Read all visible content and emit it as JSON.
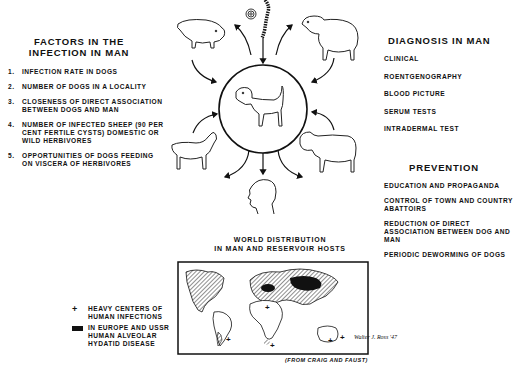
{
  "factors": {
    "title": "FACTORS IN THE INFECTION IN MAN",
    "items": [
      {
        "num": "1.",
        "text": "INFECTION RATE IN DOGS"
      },
      {
        "num": "2.",
        "text": "NUMBER OF DOGS IN A LOCALITY"
      },
      {
        "num": "3.",
        "text": "CLOSENESS OF DIRECT ASSOCIATION BETWEEN DOGS AND MAN"
      },
      {
        "num": "4.",
        "text": "NUMBER OF INFECTED SHEEP (90 PER CENT FERTILE CYSTS) DOMESTIC OR WILD HERBIVORES"
      },
      {
        "num": "5.",
        "text": "OPPORTUNITIES OF DOGS FEEDING ON VISCERA OF HERBIVORES"
      }
    ]
  },
  "diagnosis": {
    "title": "DIAGNOSIS IN MAN",
    "items": [
      "CLINICAL",
      "ROENTGENOGRAPHY",
      "BLOOD PICTURE",
      "SERUM TESTS",
      "INTRADERMAL TEST"
    ]
  },
  "prevention": {
    "title": "PREVENTION",
    "items": [
      "EDUCATION AND PROPAGANDA",
      "CONTROL OF TOWN AND COUNTRY ABATTOIRS",
      "REDUCTION OF DIRECT ASSOCIATION BETWEEN DOG AND MAN",
      "PERIODIC DEWORMING OF DOGS"
    ]
  },
  "cycle": {
    "center": "dog",
    "hosts": [
      "pig",
      "sheep",
      "goat",
      "cow"
    ],
    "sources": [
      "egg",
      "tapeworm"
    ],
    "dead_end": "man"
  },
  "map": {
    "title_line1": "WORLD DISTRIBUTION",
    "title_line2": "IN MAN AND RESERVOIR HOSTS",
    "credit": "(FROM CRAIG AND FAUST)"
  },
  "legend": {
    "items": [
      {
        "symbol": "+",
        "text": "HEAVY CENTERS OF HUMAN INFECTIONS"
      },
      {
        "symbol": "black-block",
        "text": "IN EUROPE AND USSR HUMAN ALVEOLAR HYDATID DISEASE"
      }
    ]
  },
  "signature": "Walter J. Ross '47"
}
